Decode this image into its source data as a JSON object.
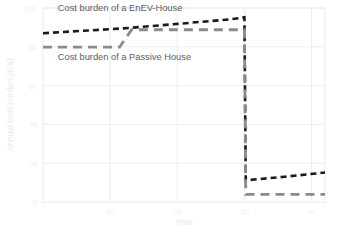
{
  "chart_data": {
    "type": "line",
    "title": "",
    "xlabel": "Year",
    "ylabel": "Annual cost burden (€/a)",
    "xlim": [
      0,
      42
    ],
    "ylim": [
      0,
      10000
    ],
    "grid": true,
    "legend_position": "inline-annotations",
    "xticks": [
      10,
      20,
      30,
      40
    ],
    "xtick_labels": [
      "10",
      "20",
      "30",
      "40"
    ],
    "yticks": [
      0,
      2000,
      4000,
      6000,
      8000,
      10000
    ],
    "ytick_labels": [
      "0",
      "2k",
      "4k",
      "6k",
      "8k",
      "10k"
    ],
    "series": [
      {
        "name": "Cost burden of a EnEV-House",
        "color": "#1a1a1a",
        "style": "dashed",
        "points": [
          [
            0,
            8700
          ],
          [
            12,
            8950
          ],
          [
            20,
            9180
          ],
          [
            28,
            9420
          ],
          [
            30,
            9520
          ],
          [
            30.2,
            1120
          ],
          [
            36,
            1300
          ],
          [
            42,
            1520
          ]
        ]
      },
      {
        "name": "Cost burden of a Passive House",
        "color": "#8a8a8a",
        "style": "dashed",
        "points": [
          [
            0,
            7980
          ],
          [
            11.4,
            7980
          ],
          [
            13.2,
            8880
          ],
          [
            30,
            8880
          ],
          [
            30.2,
            390
          ],
          [
            42,
            390
          ]
        ]
      }
    ],
    "annotations": [
      {
        "text": "Cost burden of a EnEV-House",
        "x": 2.2,
        "y": 9850
      },
      {
        "text": "Cost burden of a Passive House",
        "x": 2.2,
        "y": 7300
      }
    ]
  }
}
